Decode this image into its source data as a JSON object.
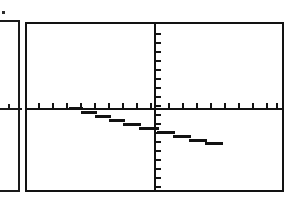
{
  "screen": {
    "device": "graphing-calculator",
    "width": 299,
    "height": 201,
    "background_color": "#ffffff",
    "ink_color": "#121212"
  },
  "partial_screen": {
    "present": true,
    "description": "right edge of an adjacent clipped calculator screen",
    "border_color": "#1a1a1a",
    "axis_label": "x-axis stub",
    "tick_count": 2,
    "ticks_x": [
      30,
      44
    ],
    "speck_artifact": true
  },
  "main_screen": {
    "border_color": "#121212",
    "frame": {
      "left": 25,
      "top": 22,
      "width": 259,
      "height": 170
    },
    "axes": {
      "x_axis_y": 84,
      "y_axis_x": 127,
      "x_tick_spacing": 14,
      "y_tick_spacing": 9,
      "x_ticks_left": [
        11,
        25,
        39,
        53,
        67,
        81,
        95,
        109,
        123
      ],
      "x_ticks_right": [
        141,
        155,
        169,
        183,
        197,
        211,
        225,
        239,
        249
      ],
      "y_ticks_above": [
        9,
        18,
        27,
        36,
        45,
        54,
        63,
        72,
        81
      ],
      "y_ticks_below": [
        90,
        99,
        108,
        117,
        126,
        135,
        144,
        153,
        162
      ]
    }
  },
  "chart_data": {
    "type": "line",
    "title": "",
    "subtitle": "",
    "xlabel": "",
    "ylabel": "",
    "grid": false,
    "legend": null,
    "axis_style": "tick-marked axes through origin",
    "xlim": [
      -10,
      10
    ],
    "ylim": [
      -10,
      10
    ],
    "series": [
      {
        "name": "Y1",
        "style": "solid",
        "color": "#121212",
        "slope": -0.22,
        "y_intercept": -1.1,
        "x_intercept": -3.9,
        "x": [
          -3.9,
          -3.0,
          -2.0,
          -1.0,
          0.0,
          1.0,
          2.0,
          3.0,
          4.0,
          4.8
        ],
        "y": [
          0.0,
          -0.2,
          -0.44,
          -0.66,
          -1.1,
          -1.32,
          -1.54,
          -1.76,
          -2.0,
          -2.2
        ],
        "pixel_steps": [
          {
            "left": 42,
            "top": 83,
            "width": 14
          },
          {
            "left": 54,
            "top": 87,
            "width": 16
          },
          {
            "left": 68,
            "top": 91,
            "width": 16
          },
          {
            "left": 82,
            "top": 95,
            "width": 16
          },
          {
            "left": 96,
            "top": 99,
            "width": 18
          },
          {
            "left": 112,
            "top": 103,
            "width": 20
          },
          {
            "left": 130,
            "top": 107,
            "width": 18
          },
          {
            "left": 146,
            "top": 111,
            "width": 18
          },
          {
            "left": 162,
            "top": 115,
            "width": 18
          },
          {
            "left": 178,
            "top": 118,
            "width": 18
          }
        ]
      }
    ]
  }
}
